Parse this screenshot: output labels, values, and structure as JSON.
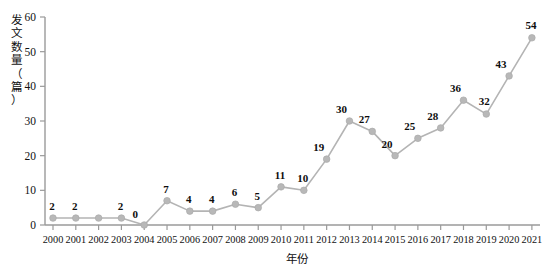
{
  "chart_data": {
    "type": "line",
    "title": "",
    "subtitle": "",
    "xlabel": "年份",
    "ylabel": "发文数量（篇）",
    "ylabel_chars": [
      "发",
      "文",
      "数",
      "量",
      "（",
      "篇",
      "）"
    ],
    "categories": [
      "2000",
      "2001",
      "2002",
      "2003",
      "2004",
      "2005",
      "2006",
      "2007",
      "2008",
      "2009",
      "2010",
      "2011",
      "2012",
      "2013",
      "2014",
      "2015",
      "2016",
      "2017",
      "2018",
      "2019",
      "2020",
      "2021"
    ],
    "values": [
      2,
      2,
      2,
      2,
      0,
      7,
      4,
      4,
      6,
      5,
      11,
      10,
      19,
      30,
      27,
      20,
      25,
      28,
      36,
      32,
      43,
      54
    ],
    "point_labels": [
      "2",
      "2",
      "",
      "2",
      "0",
      "7",
      "4",
      "4",
      "6",
      "5",
      "11",
      "10",
      "19",
      "30",
      "27",
      "20",
      "25",
      "28",
      "36",
      "32",
      "43",
      "54"
    ],
    "ylim": [
      0,
      60
    ],
    "yticks": [
      0,
      10,
      20,
      30,
      40,
      50,
      60
    ],
    "grid": false,
    "legend": "none",
    "series": [
      {
        "name": "发文数量",
        "values": [
          2,
          2,
          2,
          2,
          0,
          7,
          4,
          4,
          6,
          5,
          11,
          10,
          19,
          30,
          27,
          20,
          25,
          28,
          36,
          32,
          43,
          54
        ]
      }
    ],
    "colors": {
      "line": "#b4b4b4",
      "marker": "#b8b8b8",
      "axis": "#9a9a9a",
      "text": "#111111",
      "background": "#ffffff"
    }
  }
}
